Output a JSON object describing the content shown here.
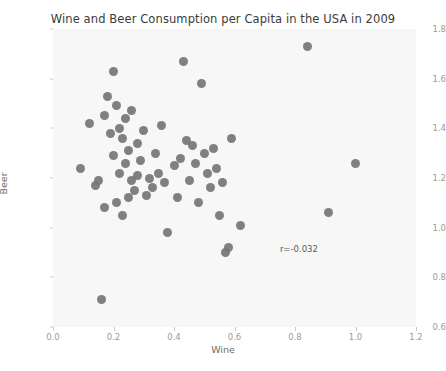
{
  "chart_data": {
    "type": "scatter",
    "title": "Wine and Beer Consumption per Capita in the USA in 2009",
    "xlabel": "Wine",
    "ylabel": "Beer",
    "xlim": [
      0.0,
      1.2
    ],
    "ylim": [
      0.6,
      1.8
    ],
    "xticks": [
      "0.0",
      "0.2",
      "0.4",
      "0.6",
      "0.8",
      "1.0",
      "1.2"
    ],
    "xtick_values": [
      0.0,
      0.2,
      0.4,
      0.6,
      0.8,
      1.0,
      1.2
    ],
    "yticks": [
      "0.6",
      "0.8",
      "1.0",
      "1.2",
      "1.4",
      "1.6",
      "1.8"
    ],
    "ytick_values": [
      0.6,
      0.8,
      1.0,
      1.2,
      1.4,
      1.6,
      1.8
    ],
    "grid": false,
    "legend": null,
    "marker_color": "#757575",
    "plot_background": "#f7f7f7",
    "figure_background": "#ffffff",
    "annotations": [
      {
        "text": "r=-0.032",
        "x": 0.75,
        "y": 0.935
      }
    ],
    "x": [
      0.09,
      0.12,
      0.14,
      0.15,
      0.16,
      0.17,
      0.17,
      0.18,
      0.19,
      0.2,
      0.2,
      0.21,
      0.21,
      0.22,
      0.22,
      0.23,
      0.23,
      0.24,
      0.24,
      0.25,
      0.25,
      0.26,
      0.26,
      0.27,
      0.28,
      0.28,
      0.29,
      0.3,
      0.31,
      0.32,
      0.33,
      0.34,
      0.35,
      0.36,
      0.37,
      0.38,
      0.4,
      0.41,
      0.42,
      0.43,
      0.44,
      0.45,
      0.46,
      0.47,
      0.48,
      0.49,
      0.5,
      0.51,
      0.52,
      0.53,
      0.54,
      0.55,
      0.56,
      0.57,
      0.58,
      0.59,
      0.62,
      0.84,
      0.91,
      1.0
    ],
    "y": [
      1.24,
      1.42,
      1.17,
      1.19,
      0.71,
      1.45,
      1.08,
      1.53,
      1.38,
      1.63,
      1.29,
      1.49,
      1.1,
      1.4,
      1.22,
      1.36,
      1.05,
      1.44,
      1.26,
      1.31,
      1.12,
      1.47,
      1.19,
      1.15,
      1.34,
      1.21,
      1.27,
      1.39,
      1.13,
      1.2,
      1.16,
      1.3,
      1.22,
      1.41,
      1.18,
      0.98,
      1.25,
      1.12,
      1.28,
      1.67,
      1.35,
      1.19,
      1.33,
      1.26,
      1.1,
      1.58,
      1.3,
      1.22,
      1.16,
      1.32,
      1.24,
      1.05,
      1.18,
      0.9,
      0.92,
      1.36,
      1.01,
      1.73,
      1.06,
      1.26
    ]
  }
}
